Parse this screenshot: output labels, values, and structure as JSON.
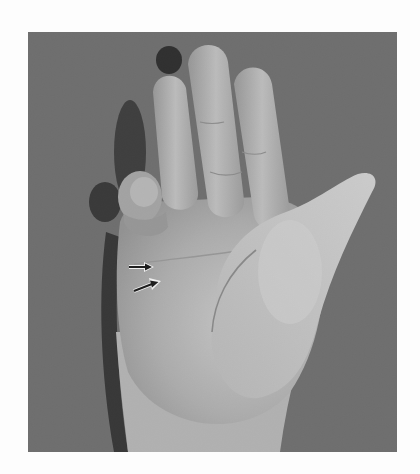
{
  "figure": {
    "background_color": "#6e6e6e",
    "page_color": "#fdfdfd",
    "annotations": [
      {
        "type": "arrow",
        "direction": "right",
        "label": "arrow-upper"
      },
      {
        "type": "arrow",
        "direction": "up-right",
        "label": "arrow-lower"
      }
    ]
  }
}
